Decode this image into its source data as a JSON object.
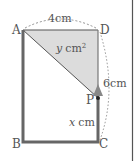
{
  "diagram": {
    "vertices": {
      "A": "A",
      "B": "B",
      "C": "C",
      "D": "D",
      "P": "P"
    },
    "dimensions": {
      "width": "4cm",
      "height": "6cm"
    },
    "shaded_area": {
      "var": "y",
      "unit": "cm",
      "exp": "2"
    },
    "distance": {
      "var": "x",
      "unit": "cm"
    },
    "colors": {
      "shade": "#d9d9d9",
      "line": "#555555",
      "thick": "#666666"
    }
  }
}
